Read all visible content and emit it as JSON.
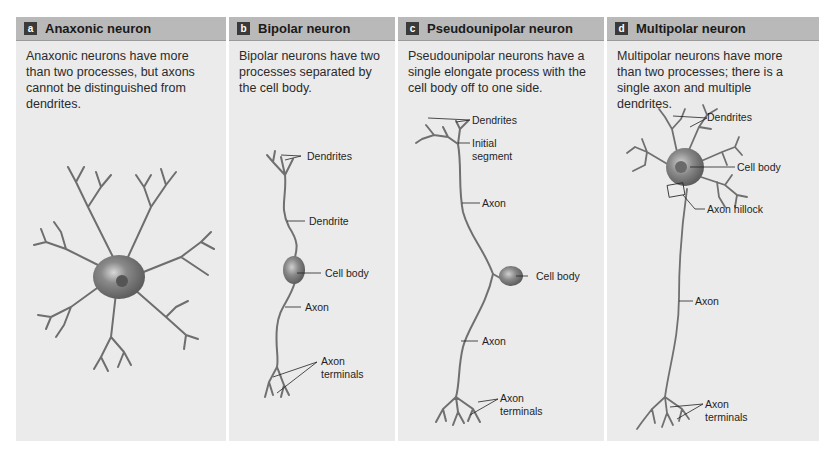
{
  "panels": [
    {
      "letter": "a",
      "title": "Anaxonic neuron",
      "description": "Anaxonic neurons have more than two processes, but axons cannot be distinguished from dendrites.",
      "labels": []
    },
    {
      "letter": "b",
      "title": "Bipolar neuron",
      "description": "Bipolar neurons have two processes separated by the cell body.",
      "labels": [
        "Dendrites",
        "Dendrite",
        "Cell body",
        "Axon",
        "Axon",
        "terminals"
      ]
    },
    {
      "letter": "c",
      "title": "Pseudounipolar neuron",
      "description": "Pseudounipolar neurons have a single elongate process with the cell body off to one side.",
      "labels": [
        "Dendrites",
        "Initial",
        "segment",
        "Axon",
        "Cell body",
        "Axon",
        "Axon",
        "terminals"
      ]
    },
    {
      "letter": "d",
      "title": "Multipolar neuron",
      "description": "Multipolar neurons have more than two processes; there is a single axon and multiple dendrites.",
      "labels": [
        "Dendrites",
        "Cell body",
        "Axon hillock",
        "Axon",
        "Axon",
        "terminals"
      ]
    }
  ],
  "colors": {
    "panel_bg": "#ebebeb",
    "header_bg": "#b9b9b9",
    "neuron": "#7a7a7a",
    "letter_box": "#3a3a3a"
  }
}
